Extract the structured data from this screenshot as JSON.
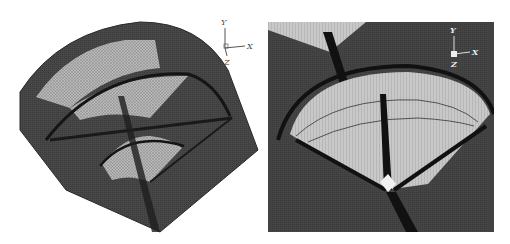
{
  "figure": {
    "panels": [
      {
        "id": "left",
        "description": "3D view of fan-shaped sector mesh with nested arcs",
        "axis_triad": {
          "y_label": "Y",
          "x_label": "X",
          "z_label": "Z"
        }
      },
      {
        "id": "right",
        "description": "Zoomed top view of sector mesh with radial lines",
        "axis_triad": {
          "y_label": "Y",
          "x_label": "X",
          "z_label": "Z"
        }
      }
    ],
    "colors": {
      "surface_dark": "#3e3e3e",
      "surface_mid": "#5a5a5a",
      "mesh_light": "#bdbdbd",
      "edge_black": "#111111",
      "background": "#ffffff"
    }
  }
}
